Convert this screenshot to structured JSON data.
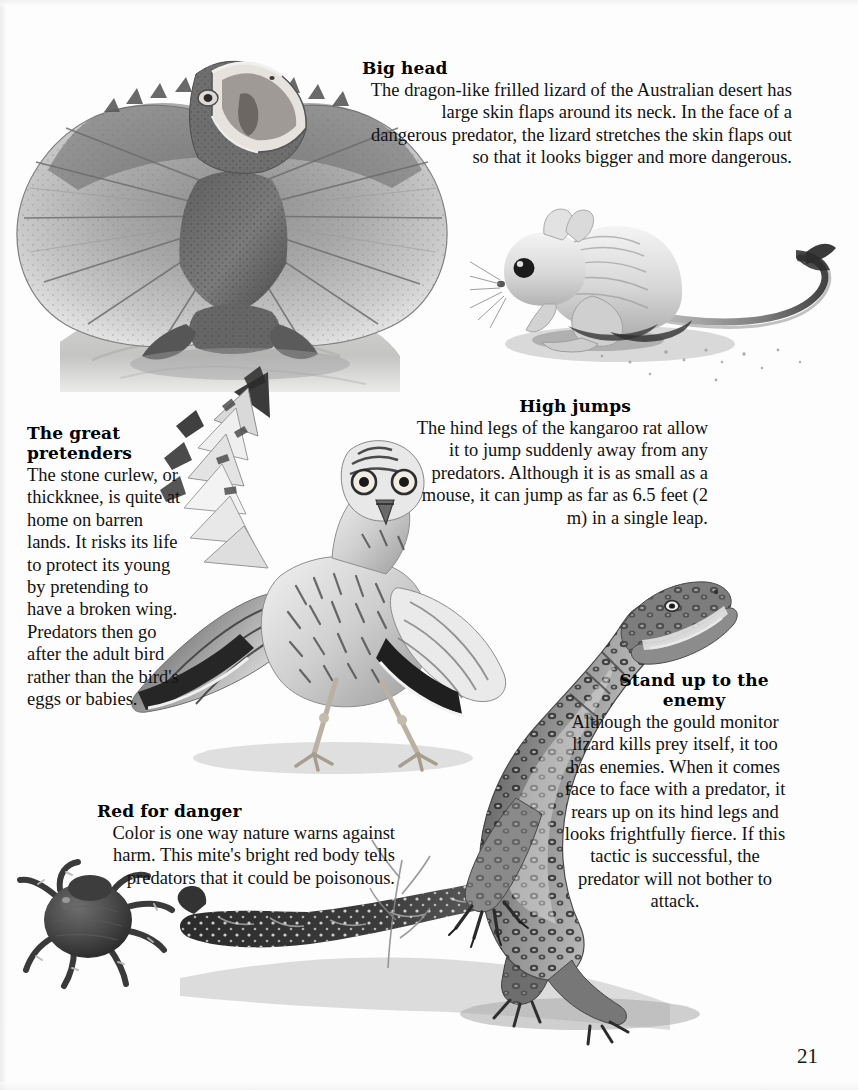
{
  "page": {
    "number": "21",
    "background_color": "#fdfdfd",
    "text_color": "#121212"
  },
  "captions": [
    {
      "id": "big-head",
      "heading": "Big head",
      "body": "The dragon-like frilled lizard of the Australian desert has large skin flaps around its neck. In the face of a dangerous predator, the lizard stretches the skin flaps out so that it looks bigger and more dangerous."
    },
    {
      "id": "high-jumps",
      "heading": "High jumps",
      "body": "The hind legs of the kangaroo rat allow it to jump suddenly away from any predators. Although it is as small as a mouse, it can jump as far as 6.5 feet (2 m) in a single leap."
    },
    {
      "id": "great-pretenders",
      "heading": "The great pretenders",
      "body": "The stone curlew, or thickknee, is quite at home on barren lands. It risks its life to protect its young by pretending to have a broken wing. Predators then go after the adult bird rather than the bird's eggs or babies."
    },
    {
      "id": "stand-up-to-the-enemy",
      "heading": "Stand up to the enemy",
      "body": "Although the gould monitor lizard kills prey itself, it too has enemies. When it comes face to face with a predator, it rears up on its hind legs and looks frightfully fierce. If this tactic is successful, the predator will not bother to attack."
    },
    {
      "id": "red-for-danger",
      "heading": "Red for danger",
      "body": "Color is one way nature warns against harm. This mite's bright red body tells predators that it could be poisonous."
    }
  ],
  "illustrations": [
    {
      "id": "frilled-lizard",
      "subject": "frilled lizard on rock with frill spread and mouth open"
    },
    {
      "id": "kangaroo-rat",
      "subject": "kangaroo rat crouching with long tufted tail"
    },
    {
      "id": "stone-curlew",
      "subject": "stone curlew bird feigning a broken wing"
    },
    {
      "id": "gould-monitor-lizard",
      "subject": "gould monitor lizard rearing on hind legs"
    },
    {
      "id": "red-mite",
      "subject": "dark round-bodied mite with eight legs"
    }
  ]
}
